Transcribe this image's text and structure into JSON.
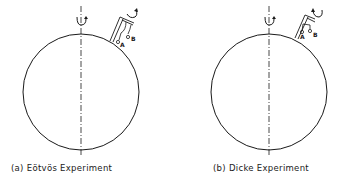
{
  "figure": {
    "panels": [
      {
        "id": "a",
        "caption": "(a) Eötvös Experiment",
        "ball_labels": [
          "A",
          "B"
        ],
        "elements": [
          "earth-circle",
          "rotation-axis",
          "axis-rotation-arrow",
          "torsion-balance-apparatus",
          "apparatus-rotation-arrow"
        ]
      },
      {
        "id": "b",
        "caption": "(b) Dicke Experiment",
        "ball_labels": [
          "A",
          "B"
        ],
        "elements": [
          "earth-circle",
          "rotation-axis",
          "axis-rotation-arrow",
          "torsion-balance-apparatus",
          "apparatus-rotation-arrow"
        ]
      }
    ],
    "colors": {
      "line": "#1a1a1a",
      "background": "#ffffff"
    }
  }
}
